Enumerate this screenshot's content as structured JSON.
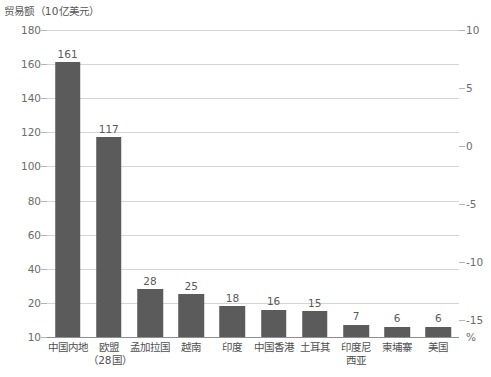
{
  "chart_data": {
    "type": "bar",
    "title": "贸易额（10亿美元）",
    "xlabel": "",
    "ylabel": "贸易额（10亿美元）",
    "y2label": "%",
    "grid": true,
    "legend": false,
    "categories": [
      "中国内地",
      "欧盟（28国）",
      "孟加拉国",
      "越南",
      "印度",
      "中国香港",
      "土耳其",
      "印度尼西亚",
      "柬埔寨",
      "美国"
    ],
    "category_lines": [
      [
        "中国内地"
      ],
      [
        "欧盟",
        "（28国）"
      ],
      [
        "孟加拉国"
      ],
      [
        "越南"
      ],
      [
        "印度"
      ],
      [
        "中国香港"
      ],
      [
        "土耳其"
      ],
      [
        "印度尼",
        "西亚"
      ],
      [
        "柬埔寨"
      ],
      [
        "美国"
      ]
    ],
    "values": [
      161,
      117,
      28,
      25,
      18,
      16,
      15,
      7,
      6,
      6
    ],
    "ylim": [
      10,
      180
    ],
    "yticks": [
      180,
      160,
      140,
      120,
      100,
      80,
      60,
      40,
      20,
      10
    ],
    "y2lim": [
      -17.5,
      10
    ],
    "y2ticks": [
      10,
      5,
      0,
      -5,
      -10,
      -15
    ],
    "bar_color": "#5b5b5b",
    "grid_color": "#d4d4d4",
    "axis_color": "#8e8e8e",
    "text_color": "#4f4f4f"
  },
  "axis": {
    "left_ticks": [
      "180",
      "160",
      "140",
      "120",
      "100",
      "80",
      "60",
      "40",
      "20",
      "10"
    ],
    "right_ticks": [
      "10",
      "5",
      "0",
      "-5",
      "-10",
      "-15"
    ],
    "percent_unit": "%"
  }
}
